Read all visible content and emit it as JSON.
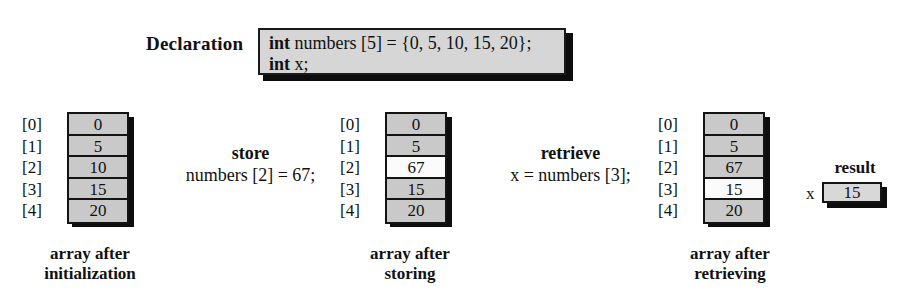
{
  "declaration": {
    "label": "Declaration",
    "lines": [
      {
        "keyword": "int",
        "rest": " numbers [5] = {0, 5, 10, 15, 20};"
      },
      {
        "keyword": "int",
        "rest": " x;"
      }
    ]
  },
  "arrays": [
    {
      "name": "array-after-initialization",
      "indices": [
        "[0]",
        "[1]",
        "[2]",
        "[3]",
        "[4]"
      ],
      "values": [
        "0",
        "5",
        "10",
        "15",
        "20"
      ],
      "highlight": -1,
      "caption_line1": "array after",
      "caption_line2": "initialization"
    },
    {
      "name": "array-after-storing",
      "indices": [
        "[0]",
        "[1]",
        "[2]",
        "[3]",
        "[4]"
      ],
      "values": [
        "0",
        "5",
        "67",
        "15",
        "20"
      ],
      "highlight": 2,
      "caption_line1": "array after",
      "caption_line2": "storing"
    },
    {
      "name": "array-after-retrieving",
      "indices": [
        "[0]",
        "[1]",
        "[2]",
        "[3]",
        "[4]"
      ],
      "values": [
        "0",
        "5",
        "67",
        "15",
        "20"
      ],
      "highlight": 3,
      "caption_line1": "array after",
      "caption_line2": "retrieving"
    }
  ],
  "operations": [
    {
      "name": "store-operation",
      "title": "store",
      "code": "numbers [2] = 67;"
    },
    {
      "name": "retrieve-operation",
      "title": "retrieve",
      "code": "x = numbers [3];"
    }
  ],
  "result": {
    "title": "result",
    "variable": "x",
    "value": "15"
  },
  "colors": {
    "cell_fill": "#c9c9c9",
    "cell_highlight": "#fbfbfb",
    "declaration_fill": "#d6d6d6",
    "border": "#141414",
    "shadow": "#0d0d0d",
    "background": "#ffffff",
    "text": "#111111"
  }
}
